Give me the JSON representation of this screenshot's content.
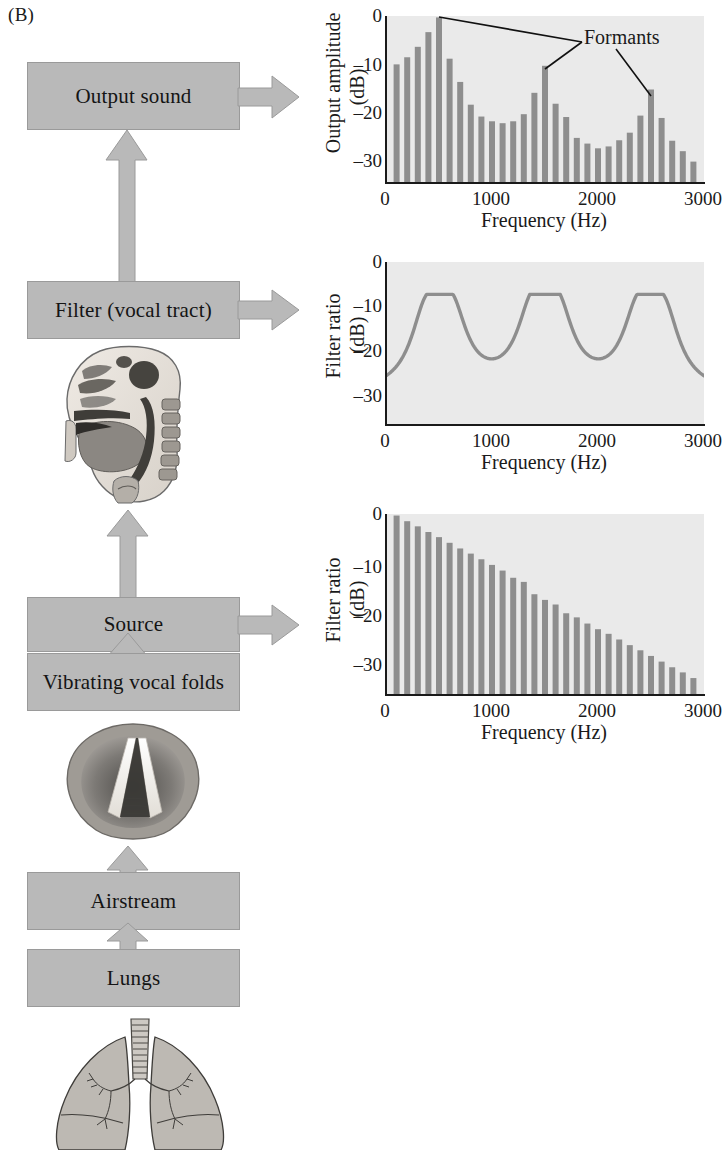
{
  "panel": {
    "label": "(B)"
  },
  "colors": {
    "box_fill": "#b9b9b9",
    "box_stroke": "#9a9a9a",
    "bar": "#8e8e8e",
    "plot_bg": "#eaeaea",
    "axis": "#1a1a1a",
    "curve": "#8e8e8e"
  },
  "flow": {
    "boxes": [
      {
        "id": "output-sound",
        "label": "Output sound"
      },
      {
        "id": "filter-vocal-tract",
        "label": "Filter (vocal tract)"
      },
      {
        "id": "source",
        "label": "Source"
      },
      {
        "id": "vibrating-vocal-folds",
        "label": "Vibrating vocal folds"
      },
      {
        "id": "airstream",
        "label": "Airstream"
      },
      {
        "id": "lungs",
        "label": "Lungs"
      }
    ],
    "illustrations": [
      {
        "id": "vocal-tract-sagittal",
        "caption": ""
      },
      {
        "id": "vocal-folds-larynx",
        "caption": ""
      },
      {
        "id": "lungs-trachea",
        "caption": ""
      }
    ]
  },
  "chart_data": [
    {
      "id": "output-spectrum",
      "type": "bar",
      "title": "",
      "xlabel": "Frequency (Hz)",
      "ylabel": "Output amplitude\n(dB)",
      "ylabel_line1": "Output amplitude",
      "ylabel_line2": "(dB)",
      "xlim": [
        0,
        3000
      ],
      "ylim": [
        -35,
        0
      ],
      "xticks": [
        0,
        1000,
        2000,
        3000
      ],
      "xticklabels": [
        "0",
        "1000",
        "2000",
        "3000"
      ],
      "yticks": [
        0,
        -10,
        -20,
        -30
      ],
      "yticklabels": [
        "0",
        "–10",
        "–20",
        "–30"
      ],
      "grid": false,
      "x": [
        100,
        200,
        300,
        400,
        500,
        600,
        700,
        800,
        900,
        1000,
        1100,
        1200,
        1300,
        1400,
        1500,
        1600,
        1700,
        1800,
        1900,
        2000,
        2100,
        2200,
        2300,
        2400,
        2500,
        2600,
        2700,
        2800,
        2900
      ],
      "values": [
        -10.2,
        -8.7,
        -6.5,
        -3.4,
        -0.3,
        -9.0,
        -13.9,
        -18.7,
        -21.2,
        -22.2,
        -22.6,
        -22.2,
        -20.7,
        -16.2,
        -10.5,
        -18.5,
        -21.3,
        -25.7,
        -26.9,
        -27.9,
        -27.5,
        -26.2,
        -24.6,
        -21.0,
        -15.5,
        -21.5,
        -26.3,
        -28.5,
        -30.7
      ],
      "annotations": [
        {
          "text": "Formants",
          "points_to_hz": [
            500,
            1500,
            2500
          ]
        }
      ]
    },
    {
      "id": "filter-transfer-function",
      "type": "line",
      "title": "",
      "xlabel": "Frequency (Hz)",
      "ylabel_line1": "Filter ratio",
      "ylabel_line2": "(dB)",
      "xlim": [
        0,
        3000
      ],
      "ylim": [
        -35,
        0
      ],
      "xticks": [
        0,
        1000,
        2000,
        3000
      ],
      "xticklabels": [
        "0",
        "1000",
        "2000",
        "3000"
      ],
      "yticks": [
        0,
        -10,
        -20,
        -30
      ],
      "yticklabels": [
        "0",
        "–10",
        "–20",
        "–30"
      ],
      "grid": false,
      "peaks_hz": [
        500,
        1500,
        2500
      ],
      "peak_value_db": -7,
      "valley_value_db": -29,
      "series": [
        {
          "name": "vocal tract filter",
          "x": [
            0,
            100,
            200,
            300,
            400,
            450,
            500,
            550,
            600,
            700,
            800,
            900,
            1000,
            1100,
            1200,
            1300,
            1400,
            1450,
            1500,
            1550,
            1600,
            1700,
            1800,
            1900,
            2000,
            2100,
            2200,
            2300,
            2400,
            2450,
            2500,
            2550,
            2600,
            2700,
            2800,
            2900,
            3000
          ],
          "values": [
            -28.2,
            -26.8,
            -23.5,
            -18.5,
            -10.5,
            -7.6,
            -7.0,
            -7.6,
            -10.6,
            -18.4,
            -24.0,
            -27.6,
            -29.0,
            -27.8,
            -24.6,
            -19.2,
            -10.6,
            -7.6,
            -7.0,
            -7.6,
            -10.8,
            -18.6,
            -24.2,
            -27.7,
            -29.0,
            -27.8,
            -24.8,
            -19.4,
            -10.7,
            -7.7,
            -7.0,
            -7.7,
            -10.9,
            -18.8,
            -24.4,
            -27.5,
            -28.9
          ]
        }
      ]
    },
    {
      "id": "source-spectrum",
      "type": "bar",
      "title": "",
      "xlabel": "Frequency (Hz)",
      "ylabel_line1": "Filter ratio",
      "ylabel_line2": "(dB)",
      "xlim": [
        0,
        3000
      ],
      "ylim": [
        -35,
        0
      ],
      "xticks": [
        0,
        1000,
        2000,
        3000
      ],
      "xticklabels": [
        "0",
        "1000",
        "2000",
        "3000"
      ],
      "yticks": [
        0,
        -10,
        -20,
        -30
      ],
      "yticklabels": [
        "0",
        "–10",
        "–20",
        "–30"
      ],
      "grid": false,
      "x": [
        100,
        200,
        300,
        400,
        500,
        600,
        700,
        800,
        900,
        1000,
        1100,
        1200,
        1300,
        1400,
        1500,
        1600,
        1700,
        1800,
        1900,
        2000,
        2100,
        2200,
        2300,
        2400,
        2500,
        2600,
        2700,
        2800,
        2900
      ],
      "values": [
        -0.3,
        -1.4,
        -2.4,
        -3.5,
        -4.5,
        -5.6,
        -6.7,
        -7.7,
        -8.8,
        -9.9,
        -11.0,
        -12.4,
        -13.2,
        -15.6,
        -16.7,
        -17.6,
        -19.3,
        -20.1,
        -21.3,
        -22.4,
        -23.3,
        -24.4,
        -25.5,
        -26.5,
        -27.6,
        -28.7,
        -29.8,
        -30.8,
        -31.9
      ]
    }
  ]
}
